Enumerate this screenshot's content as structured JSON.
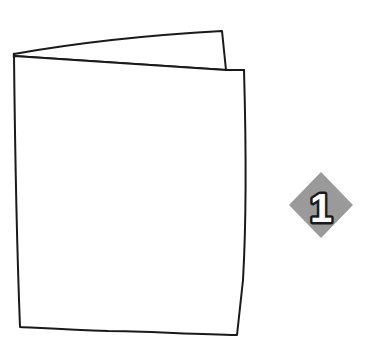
{
  "canvas": {
    "width": 379,
    "height": 361,
    "background_color": "#ffffff"
  },
  "illustration": {
    "name": "folded-card-line-drawing",
    "title": "Folded greeting card",
    "stroke_color": "#1a1a1a",
    "fill_color": "#ffffff",
    "stroke_width": 2,
    "description": "Hand drawn outline of a folded paper card standing open, seen from the front with the back panel visible behind the top edge."
  },
  "step_badge": {
    "name": "step-badge-1",
    "label": "1",
    "shape": "diamond",
    "fill_color": "#9a9a9a",
    "text_color": "#ffffff",
    "text_outline_color": "#1a1a1a",
    "center_x": 321,
    "center_y": 205,
    "half_width": 32,
    "half_height": 33
  }
}
